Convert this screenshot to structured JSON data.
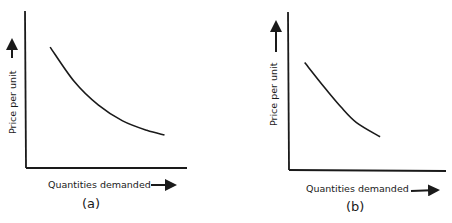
{
  "chart_data": [
    {
      "type": "line",
      "panel": "(a)",
      "title": "",
      "xlabel": "Quantities demanded",
      "ylabel": "Price per unit",
      "caption": "(a)",
      "grid": false,
      "legend": "none",
      "xlim": [
        0,
        10
      ],
      "ylim": [
        0,
        10
      ],
      "description": "Downward-sloping convex demand curve (elastic), no numeric scales",
      "series": [
        {
          "name": "demand",
          "points": [
            [
              1.5,
              7.7
            ],
            [
              3.0,
              5.5
            ],
            [
              4.5,
              4.0
            ],
            [
              6.0,
              3.0
            ],
            [
              7.5,
              2.4
            ],
            [
              8.6,
              2.1
            ]
          ]
        }
      ]
    },
    {
      "type": "line",
      "panel": "(b)",
      "title": "",
      "xlabel": "Quantities demanded",
      "ylabel": "Price per unit",
      "caption": "(b)",
      "grid": false,
      "legend": "none",
      "xlim": [
        0,
        10
      ],
      "ylim": [
        0,
        10
      ],
      "description": "Downward-sloping, nearly linear demand curve, shorter span, no numic scales",
      "series": [
        {
          "name": "demand",
          "points": [
            [
              1.0,
              6.8
            ],
            [
              2.2,
              5.3
            ],
            [
              3.3,
              4.0
            ],
            [
              4.3,
              3.0
            ],
            [
              5.8,
              2.1
            ]
          ]
        }
      ]
    }
  ]
}
